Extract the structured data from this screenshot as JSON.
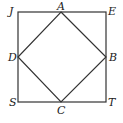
{
  "diagram": {
    "outer_square": {
      "label": "JETS",
      "vertices": [
        "J",
        "E",
        "T",
        "S"
      ]
    },
    "inner_square": {
      "label": "ABCD",
      "vertices": [
        "A",
        "B",
        "C",
        "D"
      ]
    },
    "points": {
      "J": {
        "label": "J",
        "x": 18,
        "y": 12
      },
      "E": {
        "label": "E",
        "x": 106,
        "y": 12
      },
      "T": {
        "label": "T",
        "x": 106,
        "y": 102
      },
      "S": {
        "label": "S",
        "x": 18,
        "y": 102
      },
      "A": {
        "label": "A",
        "x": 61,
        "y": 12
      },
      "B": {
        "label": "B",
        "x": 106,
        "y": 57
      },
      "C": {
        "label": "C",
        "x": 61,
        "y": 102
      },
      "D": {
        "label": "D",
        "x": 18,
        "y": 57
      }
    },
    "stroke_color": "#333333"
  }
}
